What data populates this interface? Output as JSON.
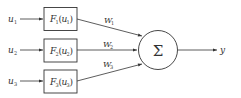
{
  "diagram": {
    "inputs": [
      {
        "label": "u",
        "sub": "1"
      },
      {
        "label": "u",
        "sub": "2"
      },
      {
        "label": "u",
        "sub": "3"
      }
    ],
    "blocks": [
      {
        "fn": "F",
        "fn_sub": "1",
        "arg": "u",
        "arg_sub": "1"
      },
      {
        "fn": "F",
        "fn_sub": "2",
        "arg": "u",
        "arg_sub": "2"
      },
      {
        "fn": "F",
        "fn_sub": "3",
        "arg": "u",
        "arg_sub": "3"
      }
    ],
    "weights": [
      {
        "label": "W",
        "sub": "1"
      },
      {
        "label": "W",
        "sub": "2"
      },
      {
        "label": "W",
        "sub": "3"
      }
    ],
    "summation": {
      "symbol": "Σ"
    },
    "output": {
      "label": "y"
    },
    "colors": {
      "stroke": "#333333",
      "background": "#ffffff"
    }
  }
}
